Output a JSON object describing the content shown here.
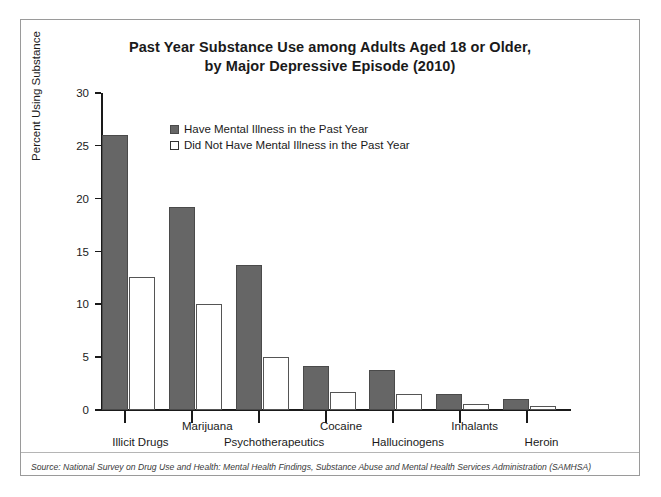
{
  "chart_data": {
    "type": "bar",
    "title": "Past Year Substance Use among Adults Aged 18 or Older, by Major Depressive Episode (2010)",
    "title_line1": "Past Year Substance Use among Adults Aged 18 or Older,",
    "title_line2": "by Major Depressive Episode (2010)",
    "xlabel": "",
    "ylabel": "Percent Using Substance",
    "ylim": [
      0,
      30
    ],
    "yticks": [
      0,
      5,
      10,
      15,
      20,
      25,
      30
    ],
    "grid": false,
    "legend_position": "top-left-inside",
    "categories": [
      "Illicit Drugs",
      "Marijuana",
      "Psychotherapeutics",
      "Cocaine",
      "Hallucinogens",
      "Inhalants",
      "Heroin"
    ],
    "series": [
      {
        "name": "Have Mental Illness in the Past Year",
        "color": "#666666",
        "values": [
          26.0,
          19.2,
          13.7,
          4.2,
          3.8,
          1.5,
          1.0
        ]
      },
      {
        "name": "Did Not Have Mental Illness in the Past Year",
        "color": "#ffffff",
        "values": [
          12.6,
          10.0,
          5.0,
          1.7,
          1.5,
          0.6,
          0.4
        ]
      }
    ],
    "source": "Source: National Survey on Drug Use and Health: Mental Health Findings, Substance Abuse and Mental Health Services Administration (SAMHSA)"
  },
  "colors": {
    "bar_dark": "#666666",
    "bar_light": "#ffffff",
    "axis": "#1a1a1a",
    "frame": "#9a9a9a",
    "text": "#1a1a1a"
  }
}
